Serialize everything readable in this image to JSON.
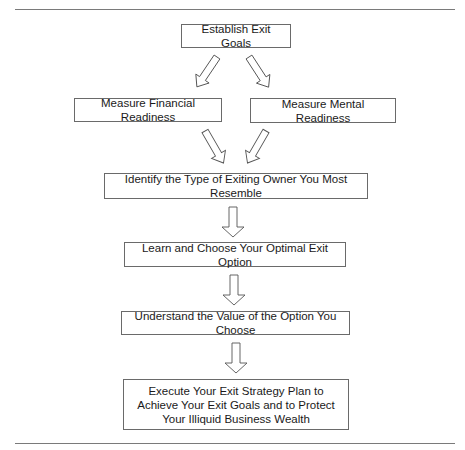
{
  "diagram": {
    "type": "flowchart",
    "nodes": [
      {
        "id": "goals",
        "label": "Establish Exit Goals"
      },
      {
        "id": "financial",
        "label": "Measure Financial Readiness"
      },
      {
        "id": "mental",
        "label": "Measure Mental Readiness"
      },
      {
        "id": "identify",
        "label": "Identify the Type of Exiting Owner You Most Resemble"
      },
      {
        "id": "learn",
        "label": "Learn and Choose Your Optimal Exit Option"
      },
      {
        "id": "value",
        "label": "Understand the Value of the Option You Choose"
      },
      {
        "id": "execute",
        "label": "Execute Your Exit Strategy Plan to Achieve Your Exit Goals and to Protect Your Illiquid Business Wealth"
      }
    ],
    "edges": [
      {
        "from": "goals",
        "to": "financial"
      },
      {
        "from": "goals",
        "to": "mental"
      },
      {
        "from": "financial",
        "to": "identify"
      },
      {
        "from": "mental",
        "to": "identify"
      },
      {
        "from": "identify",
        "to": "learn"
      },
      {
        "from": "learn",
        "to": "value"
      },
      {
        "from": "value",
        "to": "execute"
      }
    ],
    "colors": {
      "border": "#6a6a6a",
      "text": "#1a1a1a",
      "rule": "#7a7a7a",
      "background": "#ffffff"
    }
  }
}
